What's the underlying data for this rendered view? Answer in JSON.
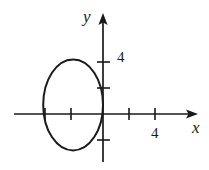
{
  "figure": {
    "kind": "coordinate-plane-graph",
    "background_color": "#ffffff",
    "stroke_color": "#1a1a1a",
    "axis_labels": {
      "x": "x",
      "y": "y"
    },
    "tick_labels": {
      "x": "4",
      "y": "4"
    }
  },
  "chart_data": {
    "type": "line",
    "title": "",
    "xlabel": "x",
    "ylabel": "y",
    "grid": false,
    "legend": null,
    "xlim": [
      -6,
      6.5
    ],
    "ylim": [
      -4,
      6.5
    ],
    "x_ticks": [
      -4,
      -2,
      2,
      4
    ],
    "y_ticks": [
      -2,
      2,
      4
    ],
    "x_tick_labels": [
      "",
      "",
      "",
      "4"
    ],
    "y_tick_labels": [
      "",
      "",
      "4"
    ],
    "axes_style": "arrows-both-ends-positive",
    "series": [
      {
        "name": "ellipse",
        "shape": "ellipse",
        "center": [
          -2.3,
          0.7
        ],
        "semi_axis_x": 2.3,
        "semi_axis_y": 3.5,
        "x_intercepts_range": [
          -4.6,
          0.0
        ],
        "y_extent_range": [
          -2.8,
          4.2
        ],
        "closed": true,
        "stroke": "#1a1a1a",
        "stroke_width": 2,
        "fill": "none"
      }
    ],
    "annotations": []
  }
}
